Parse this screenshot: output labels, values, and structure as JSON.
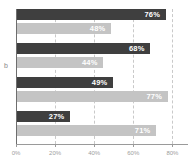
{
  "chart_data": {
    "type": "bar",
    "orientation": "horizontal",
    "title": "",
    "subtitle": "",
    "xlabel": "",
    "ylabel": "b",
    "categories": [
      "",
      "",
      "",
      ""
    ],
    "series": [
      {
        "name": "dark",
        "color": "#3f3f3f",
        "values": [
          76,
          68,
          49,
          27
        ],
        "labels": [
          "76%",
          "68%",
          "49%",
          "27%"
        ]
      },
      {
        "name": "light",
        "color": "#c4c4c4",
        "values": [
          48,
          44,
          77,
          71
        ],
        "labels": [
          "48%",
          "44%",
          "77%",
          "71%"
        ]
      }
    ],
    "xlim": [
      0,
      88
    ],
    "xticks": [
      0,
      20,
      40,
      60,
      80
    ],
    "xtick_labels": [
      "0%",
      "20%",
      "40%",
      "60%",
      "80%"
    ],
    "gridlines": [
      20,
      40,
      60,
      80
    ],
    "grid": true,
    "grid_style": "dashed",
    "legend": "none",
    "axis_color": "#9a9a9a",
    "grid_color": "#c9c9c9",
    "label_text_color": "#ffffff",
    "tick_text_color": "#9d9d9d",
    "background": "#ffffff"
  }
}
